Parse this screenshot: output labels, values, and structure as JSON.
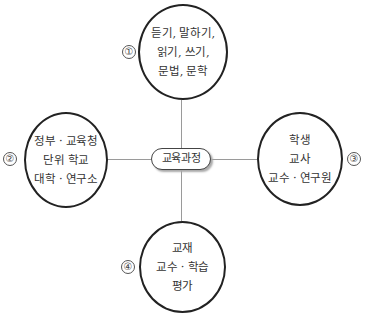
{
  "diagram": {
    "center": {
      "label": "교육과정"
    },
    "nodes": [
      {
        "marker": "①",
        "position": "top",
        "lines": [
          "듣기, 말하기,",
          "읽기, 쓰기,",
          "문법, 문학"
        ]
      },
      {
        "marker": "②",
        "position": "left",
        "lines": [
          "정부 · 교육청",
          "단위 학교",
          "대학 · 연구소"
        ]
      },
      {
        "marker": "③",
        "position": "right",
        "lines": [
          "학생",
          "교사",
          "교수 · 연구원"
        ]
      },
      {
        "marker": "④",
        "position": "bottom",
        "lines": [
          "교재",
          "교수 · 학습",
          "평가"
        ]
      }
    ],
    "colors": {
      "circle_border": "#222222",
      "connector": "#9a9a9a",
      "text": "#333333"
    }
  }
}
